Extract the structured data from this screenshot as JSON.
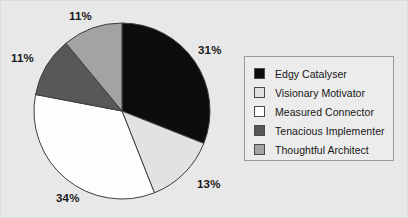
{
  "chart_data": {
    "type": "pie",
    "title": "",
    "categories": [
      "Edgy Catalyser",
      "Visionary Motivator",
      "Measured Connector",
      "Tenacious Implementer",
      "Thoughtful Architect"
    ],
    "values": [
      31,
      13,
      34,
      11,
      11
    ],
    "value_labels": [
      "31%",
      "13%",
      "34%",
      "11%",
      "11%"
    ],
    "units": "percent",
    "start_angle_deg": 0,
    "direction": "clockwise",
    "legend_position": "right",
    "grid": false,
    "slice_colors": [
      "#0d0d0d",
      "#e2e2e2",
      "#fdfdfd",
      "#585858",
      "#a3a3a3"
    ],
    "slice_outline_color": "#3d3d3d",
    "background_color": "#e8e8e8"
  },
  "labels": [
    {
      "text": "11%",
      "name": "pct-label-thoughtful-architect"
    },
    {
      "text": "11%",
      "name": "pct-label-tenacious-implementer"
    },
    {
      "text": "31%",
      "name": "pct-label-edgy-catalyser"
    },
    {
      "text": "13%",
      "name": "pct-label-visionary-motivator"
    },
    {
      "text": "34%",
      "name": "pct-label-measured-connector"
    }
  ],
  "legend": {
    "items": [
      {
        "label": "Edgy Catalyser",
        "swatch_color": "#0d0d0d"
      },
      {
        "label": "Visionary Motivator",
        "swatch_color": "#e2e2e2"
      },
      {
        "label": "Measured Connector",
        "swatch_color": "#fdfdfd"
      },
      {
        "label": "Tenacious Implementer",
        "swatch_color": "#585858"
      },
      {
        "label": "Thoughtful Architect",
        "swatch_color": "#a3a3a3"
      }
    ]
  }
}
